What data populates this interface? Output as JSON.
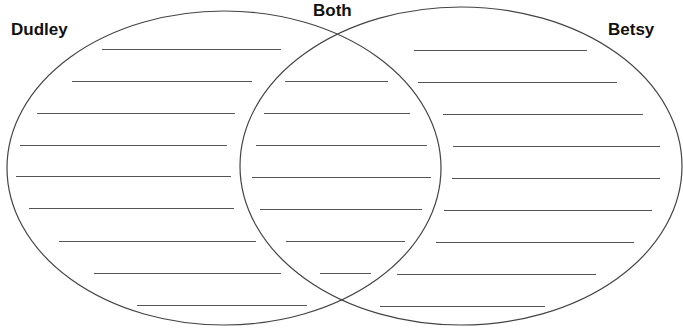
{
  "diagram": {
    "type": "venn",
    "labels": {
      "left": "Dudley",
      "center": "Both",
      "right": "Betsy"
    },
    "colors": {
      "stroke": "#444444",
      "text": "#111111",
      "background": "#ffffff"
    },
    "ellipses": {
      "left": {
        "cx": 224,
        "cy": 168,
        "rx": 217,
        "ry": 157
      },
      "right": {
        "cx": 461,
        "cy": 166,
        "rx": 221,
        "ry": 159
      }
    },
    "left_lines": [
      {
        "x1": 102,
        "x2": 281,
        "y": 49
      },
      {
        "x1": 72,
        "x2": 252,
        "y": 81
      },
      {
        "x1": 37,
        "x2": 235,
        "y": 113
      },
      {
        "x1": 20,
        "x2": 227,
        "y": 145
      },
      {
        "x1": 16,
        "x2": 231,
        "y": 176
      },
      {
        "x1": 29,
        "x2": 234,
        "y": 208
      },
      {
        "x1": 59,
        "x2": 256,
        "y": 241
      },
      {
        "x1": 94,
        "x2": 281,
        "y": 273
      },
      {
        "x1": 137,
        "x2": 307,
        "y": 305
      }
    ],
    "center_lines": [
      {
        "x1": 285,
        "x2": 388,
        "y": 81
      },
      {
        "x1": 264,
        "x2": 410,
        "y": 113
      },
      {
        "x1": 256,
        "x2": 427,
        "y": 145
      },
      {
        "x1": 252,
        "x2": 431,
        "y": 177
      },
      {
        "x1": 260,
        "x2": 422,
        "y": 209
      },
      {
        "x1": 286,
        "x2": 405,
        "y": 241
      },
      {
        "x1": 320,
        "x2": 371,
        "y": 273
      }
    ],
    "right_lines": [
      {
        "x1": 414,
        "x2": 587,
        "y": 50
      },
      {
        "x1": 418,
        "x2": 617,
        "y": 82
      },
      {
        "x1": 443,
        "x2": 643,
        "y": 114
      },
      {
        "x1": 453,
        "x2": 660,
        "y": 146
      },
      {
        "x1": 452,
        "x2": 660,
        "y": 178
      },
      {
        "x1": 444,
        "x2": 652,
        "y": 210
      },
      {
        "x1": 436,
        "x2": 634,
        "y": 242
      },
      {
        "x1": 397,
        "x2": 596,
        "y": 274
      },
      {
        "x1": 380,
        "x2": 545,
        "y": 306
      }
    ]
  }
}
